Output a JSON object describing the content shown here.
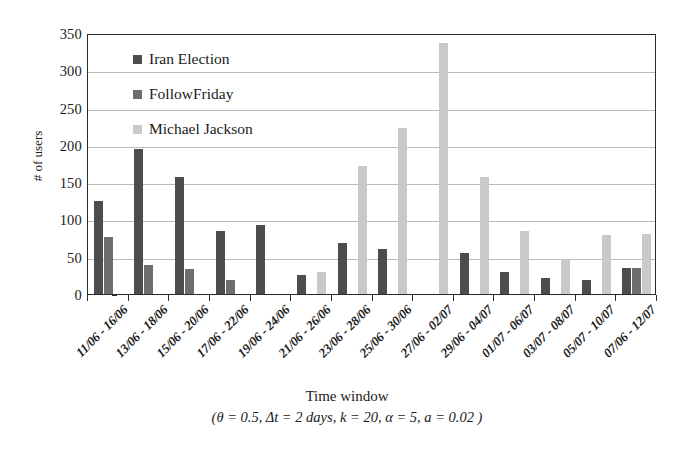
{
  "chart_data": {
    "type": "bar",
    "title": "",
    "xlabel": "Time window",
    "xlabel_params": "(θ = 0.5, Δt = 2 days, k = 20, α = 5, a = 0.02 )",
    "ylabel": "# of users",
    "ylim": [
      0,
      350
    ],
    "ytick_step": 50,
    "yticks": [
      0,
      50,
      100,
      150,
      200,
      250,
      300,
      350
    ],
    "grid": true,
    "legend_position": "top-left-inside",
    "categories": [
      "11/06 - 16/06",
      "13/06 - 18/06",
      "15/06 - 20/06",
      "17/06 - 22/06",
      "19/06 - 24/06",
      "21/06 - 26/06",
      "23/06 - 28/06",
      "25/06 - 30/06",
      "27/06 - 02/07",
      "29/06 - 04/07",
      "01/07 - 06/07",
      "03/07 - 08/07",
      "05/07 - 10/07",
      "07/06 - 12/07"
    ],
    "series": [
      {
        "name": "Iran Election",
        "color": "#4d4d4d",
        "values": [
          125,
          195,
          157,
          84,
          93,
          25,
          68,
          60,
          0,
          55,
          30,
          21,
          19,
          35
        ]
      },
      {
        "name": "FollowFriday",
        "color": "#6e6e6e",
        "values": [
          77,
          39,
          33,
          19,
          0,
          0,
          0,
          0,
          0,
          0,
          0,
          0,
          0,
          35
        ]
      },
      {
        "name": "Michael Jackson",
        "color": "#c9c9c9",
        "values": [
          0,
          0,
          0,
          0,
          0,
          30,
          172,
          222,
          336,
          157,
          84,
          47,
          79,
          81
        ]
      }
    ]
  },
  "legend": {
    "items": [
      {
        "label": "Iran Election",
        "color": "#4d4d4d"
      },
      {
        "label": "FollowFriday",
        "color": "#6e6e6e"
      },
      {
        "label": "Michael Jackson",
        "color": "#c9c9c9"
      }
    ]
  },
  "axes": {
    "y_title": "# of users",
    "x_title": "Time window",
    "x_params": "(θ = 0.5, Δt = 2 days, k = 20, α = 5, a = 0.02 )"
  },
  "colors": {
    "frame": "#2b2b2b",
    "gridline": "#b9b9b9",
    "background": "#ffffff",
    "text": "#1a1a1a"
  }
}
